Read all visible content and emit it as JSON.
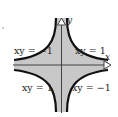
{
  "diagram": {
    "title": "",
    "colors": {
      "background": "#ffffff",
      "shade": "#c8c8c8",
      "curve": "#111111",
      "axis": "#333333"
    },
    "axes": {
      "x_label": "x",
      "y_label": "y"
    },
    "curve_labels": {
      "top_left": "xy = −1",
      "top_right": "xy = 1",
      "bottom_left": "xy = 1",
      "bottom_right": "xy = −1"
    }
  }
}
